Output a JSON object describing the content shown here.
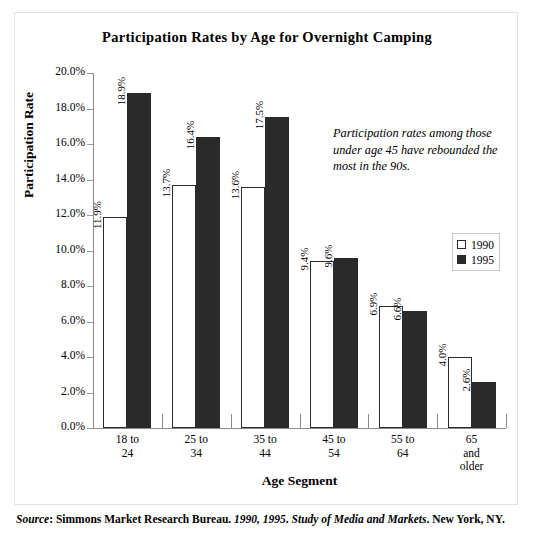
{
  "chart_data": {
    "type": "bar",
    "title": "Participation Rates by Age for Overnight Camping",
    "xlabel": "Age Segment",
    "ylabel": "Participation Rate",
    "categories": [
      "18 to 24",
      "25 to 34",
      "35 to 44",
      "45 to 54",
      "55 to 64",
      "65 and older"
    ],
    "category_lines": [
      [
        "18 to",
        "24"
      ],
      [
        "25 to",
        "34"
      ],
      [
        "35 to",
        "44"
      ],
      [
        "45 to",
        "54"
      ],
      [
        "55 to",
        "64"
      ],
      [
        "65",
        "and",
        "older"
      ]
    ],
    "series": [
      {
        "name": "1990",
        "color": "#ffffff",
        "edge_color": "#2b2b2b",
        "values": [
          11.9,
          13.7,
          13.6,
          9.4,
          6.9,
          4.0
        ],
        "labels": [
          "11.9%",
          "13.7%",
          "13.6%",
          "9.4%",
          "6.9%",
          "4.0%"
        ]
      },
      {
        "name": "1995",
        "color": "#2a2a2a",
        "edge_color": "#2a2a2a",
        "values": [
          18.9,
          16.4,
          17.5,
          9.6,
          6.6,
          2.6
        ],
        "labels": [
          "18.9%",
          "16.4%",
          "17.5%",
          "9.6%",
          "6.6%",
          "2.6%"
        ]
      }
    ],
    "ylim": [
      0.0,
      20.0
    ],
    "ytick_values": [
      0.0,
      2.0,
      4.0,
      6.0,
      8.0,
      10.0,
      12.0,
      14.0,
      16.0,
      18.0,
      20.0
    ],
    "ytick_labels": [
      "0.0%",
      "2.0%",
      "4.0%",
      "6.0%",
      "8.0%",
      "10.0%",
      "12.0%",
      "14.0%",
      "16.0%",
      "18.0%",
      "20.0%"
    ],
    "grid": false,
    "legend_position": "right-middle",
    "data_label_rotation": 90,
    "annotation": "Participation rates among those under age 45 have rebounded the most in the 90s."
  },
  "legend": {
    "entries": [
      {
        "label": "1990"
      },
      {
        "label": "1995"
      }
    ]
  },
  "source": {
    "prefix": "Source",
    "colon": ": ",
    "publisher": "Simmons Market Research Bureau. ",
    "years": "1990, 1995",
    "sep1": ". ",
    "publication": "Study of Media and Markets",
    "sep2": ". ",
    "location": "New York, NY."
  }
}
